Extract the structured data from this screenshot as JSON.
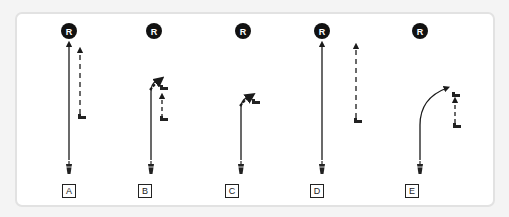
{
  "diagram": {
    "title": "",
    "reference_marker": "R",
    "colors": {
      "line": "#1a1a1a",
      "marker_fill": "#111111",
      "marker_text": "#ffffff",
      "panel_border": "#e2e2e2",
      "background": "#ffffff"
    },
    "scenarios": [
      {
        "id": "A",
        "label": "A",
        "description": "Straight solid path from bottom player to R; dashed path from right-side player straight up"
      },
      {
        "id": "B",
        "label": "B",
        "description": "Solid path curves right near top toward second player; short dashed path from lower player up"
      },
      {
        "id": "C",
        "label": "C",
        "description": "Solid path curves right and ends near a player icon"
      },
      {
        "id": "D",
        "label": "D",
        "description": "Straight solid path to R; long dashed path from right-side player straight up"
      },
      {
        "id": "E",
        "label": "E",
        "description": "Solid path curves right toward a player; short dashed path between two players"
      }
    ]
  }
}
